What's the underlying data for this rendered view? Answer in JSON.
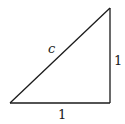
{
  "diagram": {
    "type": "right-triangle",
    "stroke_color": "#1a1a1a",
    "background": "#ffffff",
    "vertices": {
      "bottom_left": [
        10,
        103
      ],
      "bottom_right": [
        110,
        103
      ],
      "top_right": [
        110,
        8
      ]
    },
    "labels": {
      "hypotenuse": "c",
      "vertical_leg": "1",
      "horizontal_leg": "1"
    }
  }
}
